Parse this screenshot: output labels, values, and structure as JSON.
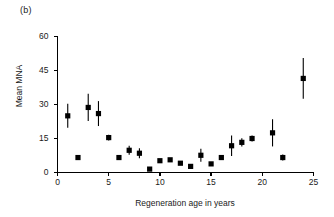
{
  "figure": {
    "panel_label": "(b)",
    "background_color": "#ffffff",
    "marker_color": "#000000",
    "axis_color": "#000000"
  },
  "chart_data": {
    "type": "scatter",
    "title": "",
    "subtitle": "",
    "xlabel": "Regeneration age in years",
    "ylabel": "Mean MNA",
    "xlim": [
      0,
      25
    ],
    "ylim": [
      0,
      60
    ],
    "xticks": [
      0,
      5,
      10,
      15,
      20,
      25
    ],
    "yticks": [
      0,
      15,
      30,
      45,
      60
    ],
    "xtick_labels": [
      "0",
      "5",
      "10",
      "15",
      "20",
      "25"
    ],
    "ytick_labels": [
      "0",
      "15",
      "30",
      "45",
      "60"
    ],
    "grid": false,
    "legend": null,
    "marker": "square",
    "error_bars": "vertical",
    "series": [
      {
        "name": "Mean MNA",
        "x": [
          1,
          2,
          3,
          4,
          5,
          6,
          7,
          8,
          9,
          10,
          11,
          12,
          13,
          14,
          15,
          16,
          17,
          18,
          19,
          21,
          22,
          24
        ],
        "values": [
          25.0,
          6.6,
          28.7,
          26.0,
          15.4,
          6.6,
          9.8,
          8.5,
          1.5,
          5.2,
          5.6,
          4.1,
          2.7,
          7.6,
          3.8,
          6.6,
          11.8,
          13.3,
          15.0,
          17.5,
          6.6,
          41.5
        ],
        "errors": [
          5.3,
          0.0,
          6.0,
          5.5,
          1.3,
          0.0,
          2.0,
          2.2,
          0.0,
          0.0,
          0.0,
          0.0,
          0.0,
          2.9,
          0.0,
          0.0,
          4.5,
          1.8,
          1.3,
          6.0,
          1.3,
          9.0
        ]
      }
    ]
  }
}
